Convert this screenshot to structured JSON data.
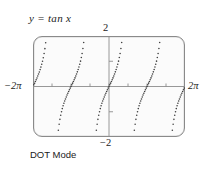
{
  "figure": {
    "title": "y = tan x",
    "caption": "DOT Mode"
  },
  "labels": {
    "top": "2",
    "bottom": "−2",
    "left": "−2π",
    "right": "2π"
  },
  "colors": {
    "curve": "#3d3d3d",
    "axis": "#8c8c8c",
    "frame": "#8a8a8a",
    "screen_bg": "#fbfbfb",
    "text": "#1b1b1b",
    "page_bg": "#ffffff"
  },
  "chart_data": {
    "type": "scatter",
    "title": "y = tan x",
    "subtitle": "DOT Mode",
    "xlabel": "",
    "ylabel": "",
    "function": "y = tan x",
    "render_style": "dotted",
    "grid": false,
    "legend": null,
    "xlim": [
      -6.2831853,
      6.2831853
    ],
    "ylim": [
      -2,
      2
    ],
    "xlim_label": [
      "−2π",
      "2π"
    ],
    "ylim_label": [
      "−2",
      "2"
    ],
    "xticks": [
      -6.2831853,
      -4.712389,
      -3.1415927,
      -1.5707963,
      0,
      1.5707963,
      3.1415927,
      4.712389,
      6.2831853
    ],
    "xtick_labels": [
      "−2π",
      "",
      "",
      "",
      "",
      "",
      "",
      "",
      "2π"
    ],
    "yticks": [
      -2,
      -1,
      0,
      1,
      2
    ],
    "ytick_labels": [
      "−2",
      "",
      "",
      "",
      "2"
    ],
    "asymptotes": [
      -4.712389,
      -1.5707963,
      1.5707963,
      4.712389
    ],
    "branches": [
      {
        "name": "branch-1",
        "x_range": [
          -6.2831853,
          -4.712389
        ],
        "through": [
          [
            -6.2831853,
            0
          ]
        ]
      },
      {
        "name": "branch-2",
        "x_range": [
          -4.712389,
          -1.5707963
        ],
        "through": [
          [
            -3.1415927,
            0
          ]
        ]
      },
      {
        "name": "branch-3",
        "x_range": [
          -1.5707963,
          1.5707963
        ],
        "through": [
          [
            0,
            0
          ]
        ]
      },
      {
        "name": "branch-4",
        "x_range": [
          1.5707963,
          4.712389
        ],
        "through": [
          [
            3.1415927,
            0
          ]
        ]
      },
      {
        "name": "branch-5",
        "x_range": [
          4.712389,
          6.2831853
        ],
        "through": [
          [
            6.2831853,
            0
          ]
        ]
      }
    ],
    "series": [
      {
        "name": "tan x",
        "x": [
          -6.2831853,
          -6.0868,
          -5.8905,
          -5.6941,
          -5.4978,
          -5.3014,
          -5.1051,
          -4.9087,
          -4.4179,
          -4.2215,
          -4.0252,
          -3.8288,
          -3.6325,
          -3.4361,
          -3.2398,
          -3.1416,
          -3.0434,
          -2.847,
          -2.6507,
          -2.4544,
          -2.258,
          -2.0617,
          -1.8653,
          -1.669,
          -1.4726,
          -1.2763,
          -1.0799,
          -0.8836,
          -0.6872,
          -0.4909,
          -0.2945,
          -0.0982,
          0.0982,
          0.2945,
          0.4909,
          0.6872,
          0.8836,
          1.0799,
          1.2763,
          1.4726,
          1.669,
          1.8653,
          2.0617,
          2.258,
          2.4544,
          2.6507,
          2.847,
          3.0434,
          3.1416,
          3.2398,
          3.4361,
          3.6325,
          3.8288,
          4.0252,
          4.2215,
          4.4179,
          4.9087,
          5.1051,
          5.3014,
          5.4978,
          5.6941,
          5.8905,
          6.0868,
          6.2831853
        ],
        "y": [
          0,
          0.1989,
          0.4142,
          0.6682,
          1.0,
          1.4966,
          2.0,
          2.0,
          -2.0,
          -2.0,
          -1.4966,
          -1.0,
          -0.6682,
          -0.4142,
          -0.1989,
          0,
          0.1989,
          0.4142,
          0.6682,
          1.0,
          1.4966,
          2.0,
          2.0,
          2.0,
          -2.0,
          -2.0,
          -1.804,
          -1.1918,
          -0.8211,
          -0.5317,
          -0.3035,
          -0.0985,
          0.0985,
          0.3035,
          0.5317,
          0.8211,
          1.1918,
          1.804,
          2.0,
          2.0,
          -2.0,
          -2.0,
          -2.0,
          -1.4966,
          -1.0,
          -0.6682,
          -0.4142,
          -0.1989,
          0,
          0.1989,
          0.4142,
          0.6682,
          1.0,
          1.4966,
          2.0,
          2.0,
          -2.0,
          -2.0,
          -1.4966,
          -1.0,
          -0.6682,
          -0.4142,
          -0.1989,
          0
        ]
      }
    ]
  }
}
